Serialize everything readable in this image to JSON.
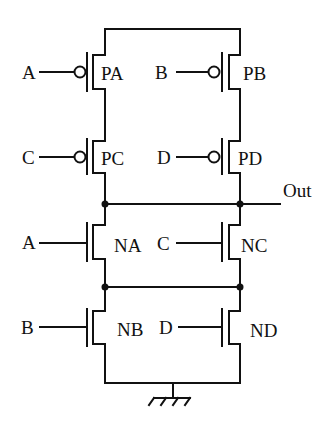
{
  "diagram": {
    "output_label": "Out",
    "ground_label": "ground-symbol",
    "transistors": [
      {
        "id": "PA",
        "label": "PA",
        "type": "PMOS",
        "input": "A"
      },
      {
        "id": "PB",
        "label": "PB",
        "type": "PMOS",
        "input": "B"
      },
      {
        "id": "PC",
        "label": "PC",
        "type": "PMOS",
        "input": "C"
      },
      {
        "id": "PD",
        "label": "PD",
        "type": "PMOS",
        "input": "D"
      },
      {
        "id": "NA",
        "label": "NA",
        "type": "NMOS",
        "input": "A"
      },
      {
        "id": "NC",
        "label": "NC",
        "type": "NMOS",
        "input": "C"
      },
      {
        "id": "NB",
        "label": "NB",
        "type": "NMOS",
        "input": "B"
      },
      {
        "id": "ND",
        "label": "ND",
        "type": "NMOS",
        "input": "D"
      }
    ],
    "inputs": {
      "pa": "A",
      "pb": "B",
      "pc": "C",
      "pd": "D",
      "na": "A",
      "nc": "C",
      "nb": "B",
      "nd": "D"
    },
    "labels": {
      "pa": "PA",
      "pb": "PB",
      "pc": "PC",
      "pd": "PD",
      "na": "NA",
      "nc": "NC",
      "nb": "NB",
      "nd": "ND"
    }
  }
}
